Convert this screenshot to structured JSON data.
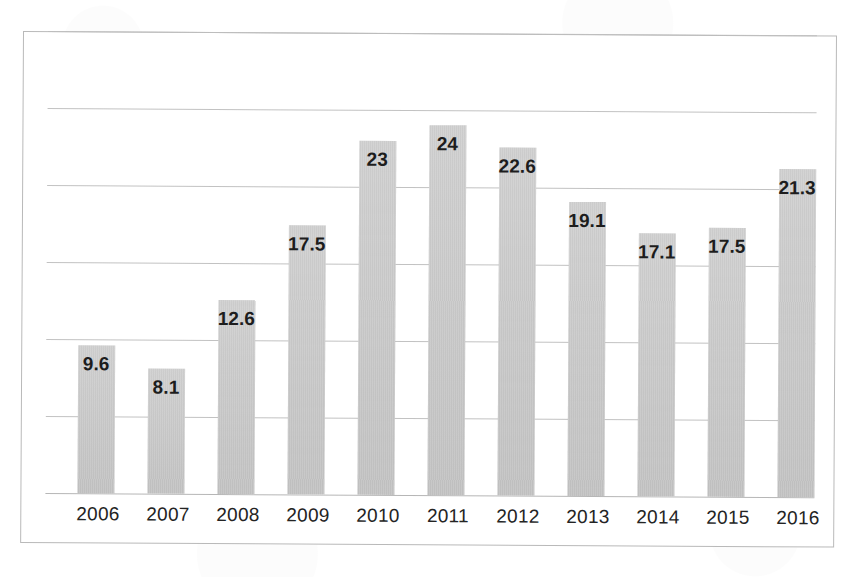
{
  "chart_data": {
    "type": "bar",
    "title": "",
    "subtitle": "",
    "xlabel": "",
    "ylabel": "",
    "categories": [
      "2006",
      "2007",
      "2008",
      "2009",
      "2010",
      "2011",
      "2012",
      "2013",
      "2014",
      "2015",
      "2016"
    ],
    "values": [
      9.6,
      8.1,
      12.6,
      17.5,
      23,
      24,
      22.6,
      19.1,
      17.1,
      17.5,
      21.3
    ],
    "value_labels": [
      "9.6",
      "8.1",
      "12.6",
      "17.5",
      "23",
      "24",
      "22.6",
      "19.1",
      "17.1",
      "17.5",
      "21.3"
    ],
    "series": [
      {
        "name": "",
        "values": [
          9.6,
          8.1,
          12.6,
          17.5,
          23,
          24,
          22.6,
          19.1,
          17.1,
          17.5,
          21.3
        ]
      }
    ],
    "ylim": [
      0,
      30
    ],
    "y_gridline_values": [
      30,
      25,
      20,
      15,
      10,
      5,
      0
    ],
    "grid": "horizontal",
    "y_axis_labels_visible": false,
    "legend": "none",
    "legend_position": "none",
    "data_labels": "inside-top",
    "bar_color": "#cacaca",
    "gridline_color": "#bdbdbd",
    "frame_color": "#b9b9b9",
    "label_text_color": "#1d1d1d",
    "background_color": "#ffffff"
  },
  "chart": {
    "frame_name": "chart-border",
    "plot_name": "plot-area"
  }
}
